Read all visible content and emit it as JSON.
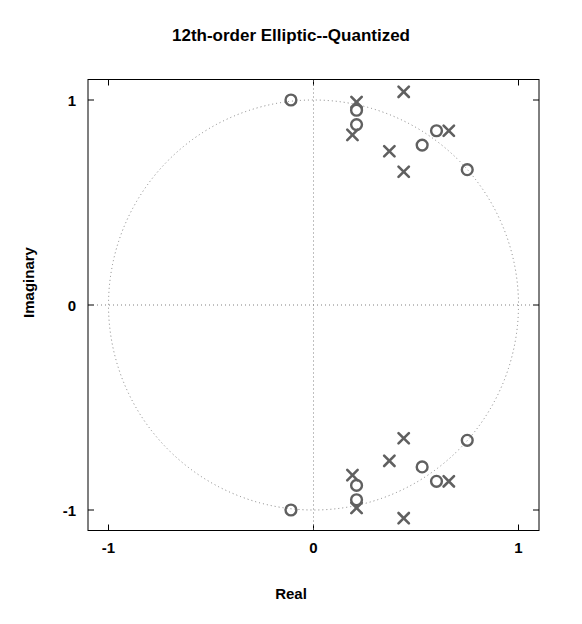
{
  "chart_data": {
    "type": "scatter",
    "title": "12th-order Elliptic--Quantized",
    "xlabel": "Real",
    "ylabel": "Imaginary",
    "xlim": [
      -1.1,
      1.1
    ],
    "ylim": [
      -1.1,
      1.1
    ],
    "xticks": [
      -1,
      0,
      1
    ],
    "yticks": [
      -1,
      0,
      1
    ],
    "xtick_labels": [
      "-1",
      "0",
      "1"
    ],
    "ytick_labels": [
      "-1",
      "0",
      "1"
    ],
    "grid": false,
    "legend": "none",
    "marker_color": "#606060",
    "axis_color": "#000000",
    "reference_circle": {
      "name": "unit-circle",
      "radius": 1,
      "center": [
        0,
        0
      ],
      "style": "dotted",
      "color": "#808080"
    },
    "reference_axes": {
      "style": "dotted",
      "color": "#808080"
    },
    "series": [
      {
        "name": "zeros",
        "marker": "o",
        "count": 12,
        "points": [
          [
            -0.11,
            1.0
          ],
          [
            0.21,
            0.95
          ],
          [
            0.21,
            0.88
          ],
          [
            0.6,
            0.85
          ],
          [
            0.53,
            0.78
          ],
          [
            0.75,
            0.66
          ],
          [
            0.75,
            -0.66
          ],
          [
            0.53,
            -0.79
          ],
          [
            0.6,
            -0.86
          ],
          [
            0.21,
            -0.88
          ],
          [
            0.21,
            -0.95
          ],
          [
            -0.11,
            -1.0
          ]
        ]
      },
      {
        "name": "poles",
        "marker": "x",
        "count": 12,
        "points": [
          [
            0.21,
            0.99
          ],
          [
            0.44,
            1.04
          ],
          [
            0.19,
            0.83
          ],
          [
            0.66,
            0.85
          ],
          [
            0.37,
            0.75
          ],
          [
            0.44,
            0.65
          ],
          [
            0.44,
            -0.65
          ],
          [
            0.37,
            -0.76
          ],
          [
            0.66,
            -0.86
          ],
          [
            0.19,
            -0.83
          ],
          [
            0.44,
            -1.04
          ],
          [
            0.21,
            -0.99
          ]
        ]
      }
    ]
  }
}
